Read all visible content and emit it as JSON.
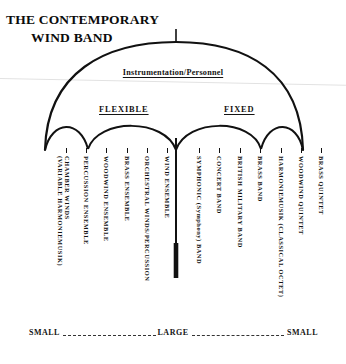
{
  "title": {
    "line1": "THE CONTEMPORARY",
    "line2": "WIND BAND"
  },
  "canopy": {
    "instrumentation_label": "Instrumentation/Personnel",
    "flexible_label": "FLEXIBLE",
    "fixed_label": "FIXED"
  },
  "scale": {
    "left": "SMALL",
    "center": "LARGE",
    "right": "SMALL"
  },
  "ensembles": [
    {
      "id": "chamber-winds",
      "line1": "CHAMBER WINDS",
      "line2": "(VARIABLE HARMONIEMUSIK)",
      "x": 66,
      "side": "flexible"
    },
    {
      "id": "percussion-ensemble",
      "line1": "PERCUSSION ENSEMBLE",
      "line2": "",
      "x": 86,
      "side": "flexible"
    },
    {
      "id": "woodwind-ensemble",
      "line1": "WOODWIND ENSEMBLE",
      "line2": "",
      "x": 106,
      "side": "flexible"
    },
    {
      "id": "brass-ensemble",
      "line1": "BRASS ENSEMBLE",
      "line2": "",
      "x": 127,
      "side": "flexible"
    },
    {
      "id": "orchestral-winds",
      "line1": "ORCHESTRAL WINDS/PERCUSSION",
      "line2": "",
      "x": 147,
      "side": "flexible"
    },
    {
      "id": "wind-ensemble",
      "line1": "WIND ENSEMBLE",
      "line2": "",
      "x": 167,
      "side": "flexible"
    },
    {
      "id": "symphonic-band",
      "line1": "SYMPHONIC (Symphony) BAND",
      "line2": "",
      "x": 199,
      "side": "fixed"
    },
    {
      "id": "concert-band",
      "line1": "CONCERT BAND",
      "line2": "",
      "x": 219,
      "side": "fixed"
    },
    {
      "id": "british-military-band",
      "line1": "BRITISH MILITARY BAND",
      "line2": "",
      "x": 240,
      "side": "fixed"
    },
    {
      "id": "brass-band",
      "line1": "BRASS BAND",
      "line2": "",
      "x": 260,
      "side": "fixed"
    },
    {
      "id": "harmoniemusik",
      "line1": "HARMONIEMUSIK (CLASSICAL OCTET)",
      "line2": "",
      "x": 281,
      "side": "fixed"
    },
    {
      "id": "woodwind-quintet",
      "line1": "WOODWIND QUINTET",
      "line2": "",
      "x": 301,
      "side": "fixed"
    },
    {
      "id": "brass-quintet",
      "line1": "BRASS QUINTET",
      "line2": "",
      "x": 321,
      "side": "fixed"
    }
  ],
  "colors": {
    "ink": "#111111",
    "paper": "#ffffff"
  }
}
